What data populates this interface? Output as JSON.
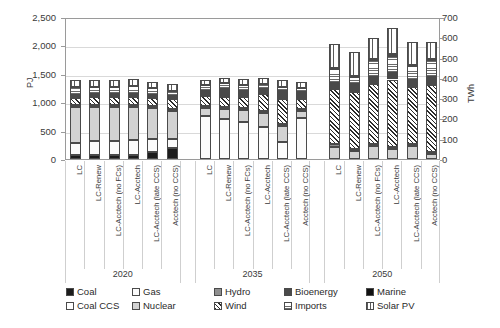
{
  "chart_data": {
    "type": "bar",
    "subtype": "stacked-bar-grouped",
    "title": "",
    "xlabel": "",
    "ylabel": "PJ",
    "ylabel_secondary": "TWh",
    "ylim": [
      0,
      2500
    ],
    "ylim_secondary": [
      0,
      700
    ],
    "yticks": [
      "0",
      "500",
      "1,000",
      "1,500",
      "2,000",
      "2,500"
    ],
    "ytick_values": [
      0,
      500,
      1000,
      1500,
      2000,
      2500
    ],
    "yticks_secondary": [
      "0",
      "100",
      "200",
      "300",
      "400",
      "500",
      "600",
      "700"
    ],
    "ytick_values_secondary": [
      0,
      100,
      200,
      300,
      400,
      500,
      600,
      700
    ],
    "grid": true,
    "legend_position": "bottom",
    "group_labels": [
      "2020",
      "2035",
      "2050"
    ],
    "categories": [
      "LC",
      "LC-Renew",
      "LC-Acctech (no FCs)",
      "LC-Acctech",
      "LC-Acctech (late CCS)",
      "Acctech (no CCS)",
      "LC",
      "LC-Renew",
      "LC-Acctech (no FCs)",
      "LC-Acctech",
      "LC-Acctech (late CCS)",
      "Acctech (no CCS)",
      "LC",
      "LC-Renew",
      "LC-Acctech (no FCs)",
      "LC-Acctech",
      "LC-Acctech (late CCS)",
      "Acctech (no CCS)"
    ],
    "series": [
      {
        "name": "Coal",
        "pattern": "solid-black",
        "values": [
          75,
          75,
          75,
          75,
          130,
          195,
          0,
          0,
          0,
          0,
          0,
          0,
          0,
          0,
          0,
          0,
          0,
          0
        ]
      },
      {
        "name": "Coal CCS",
        "pattern": "white",
        "values": [
          0,
          0,
          0,
          0,
          0,
          0,
          0,
          0,
          0,
          0,
          0,
          0,
          0,
          0,
          0,
          0,
          0,
          0
        ]
      },
      {
        "name": "Gas",
        "pattern": "near-white",
        "values": [
          215,
          240,
          250,
          260,
          220,
          150,
          760,
          700,
          660,
          560,
          300,
          730,
          0,
          0,
          0,
          0,
          0,
          0
        ]
      },
      {
        "name": "Nuclear",
        "pattern": "light-grey",
        "values": [
          620,
          600,
          585,
          575,
          540,
          500,
          135,
          175,
          205,
          250,
          280,
          110,
          220,
          135,
          230,
          180,
          230,
          90
        ]
      },
      {
        "name": "Hydro",
        "pattern": "mid-grey",
        "values": [
          35,
          35,
          35,
          35,
          35,
          35,
          40,
          40,
          40,
          40,
          40,
          40,
          40,
          40,
          40,
          40,
          40,
          40
        ]
      },
      {
        "name": "Wind",
        "pattern": "diagonal-hatch",
        "values": [
          130,
          135,
          140,
          145,
          150,
          175,
          175,
          185,
          190,
          300,
          440,
          170,
          980,
          1000,
          1050,
          1180,
          1000,
          1180
        ]
      },
      {
        "name": "Bioenergy",
        "pattern": "dark-grey",
        "values": [
          60,
          60,
          60,
          60,
          60,
          60,
          90,
          130,
          110,
          75,
          140,
          130,
          90,
          140,
          130,
          120,
          120,
          140
        ]
      },
      {
        "name": "Imports",
        "pattern": "horizontal-hatch",
        "values": [
          130,
          130,
          130,
          130,
          110,
          80,
          105,
          105,
          105,
          90,
          60,
          70,
          260,
          135,
          290,
          300,
          240,
          285
        ]
      },
      {
        "name": "Marine",
        "pattern": "solid-black-2",
        "values": [
          0,
          0,
          0,
          0,
          0,
          0,
          0,
          0,
          0,
          0,
          0,
          0,
          20,
          20,
          20,
          25,
          20,
          20
        ]
      },
      {
        "name": "Solar PV",
        "pattern": "vertical-hatch",
        "values": [
          120,
          120,
          120,
          120,
          110,
          130,
          90,
          90,
          95,
          110,
          130,
          110,
          410,
          410,
          370,
          470,
          410,
          310
        ]
      }
    ],
    "bar_totals": [
      1385,
      1395,
      1395,
      1400,
      1355,
      1325,
      1395,
      1425,
      1405,
      1425,
      1390,
      1360,
      2020,
      1880,
      2130,
      2315,
      2060,
      2065
    ]
  },
  "legend": {
    "items": [
      {
        "label": "Coal",
        "swatch": "coal-swatch"
      },
      {
        "label": "Coal CCS",
        "swatch": "coal-ccs-swatch"
      },
      {
        "label": "Gas",
        "swatch": "gas-swatch"
      },
      {
        "label": "Nuclear",
        "swatch": "nuclear-swatch"
      },
      {
        "label": "Hydro",
        "swatch": "hydro-swatch"
      },
      {
        "label": "Wind",
        "swatch": "wind-swatch"
      },
      {
        "label": "Bioenergy",
        "swatch": "bioenergy-swatch"
      },
      {
        "label": "Imports",
        "swatch": "imports-swatch"
      },
      {
        "label": "Marine",
        "swatch": "marine-swatch"
      },
      {
        "label": "Solar PV",
        "swatch": "solar-pv-swatch"
      }
    ]
  },
  "colors": {
    "axis": "#9a9a9a",
    "grid": "#d9d9d9",
    "text": "#3a3a3a",
    "coal": "#1c1c1c",
    "coal_ccs": "#ffffff",
    "gas": "#fbfbfb",
    "nuclear": "#d2d2d2",
    "hydro": "#8f8f8f",
    "wind": "#f2f2f2",
    "bioenergy": "#4a4a4a",
    "imports": "#e2e2e2",
    "marine": "#111111",
    "solar_pv": "#efefef"
  }
}
